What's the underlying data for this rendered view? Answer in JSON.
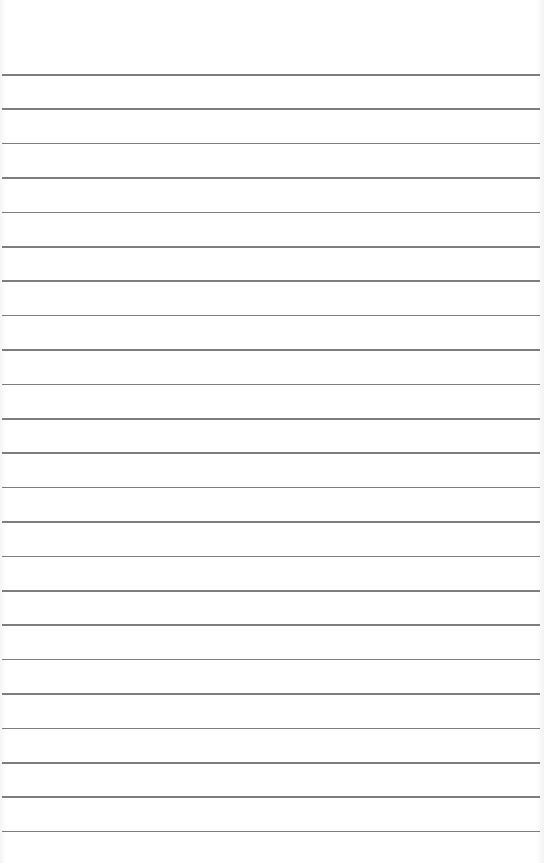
{
  "paper": {
    "type": "lined-paper",
    "background_color": "#ffffff",
    "line_color": "#7d7d7d",
    "line_count": 23,
    "first_line_y": 74,
    "line_spacing": 34.4
  }
}
